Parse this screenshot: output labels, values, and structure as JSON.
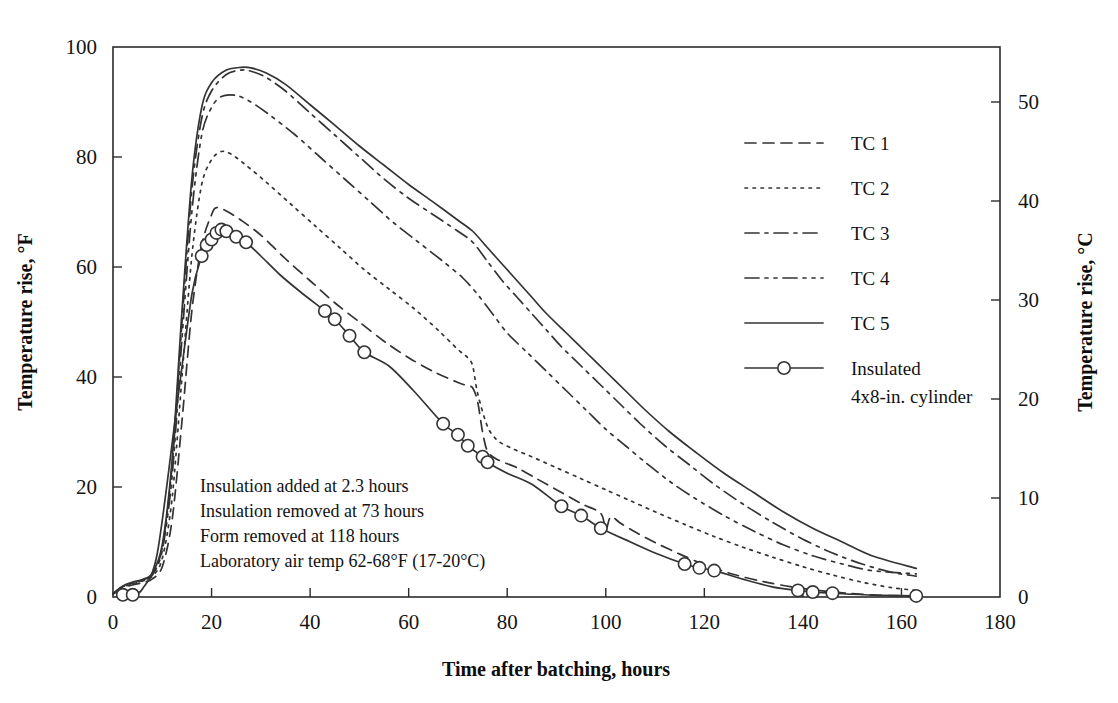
{
  "chart_data": {
    "type": "line",
    "title": "",
    "xlabel": "Time after batching, hours",
    "ylabel": "Temperature rise, °F",
    "ylabel_right": "Temperature rise, °C",
    "xlim": [
      0,
      180
    ],
    "ylim": [
      0,
      100
    ],
    "ylim_right": [
      0,
      55.6
    ],
    "xticks": [
      "0",
      "20",
      "40",
      "60",
      "80",
      "100",
      "120",
      "140",
      "160",
      "180"
    ],
    "xtick_values": [
      0,
      20,
      40,
      60,
      80,
      100,
      120,
      140,
      160,
      180
    ],
    "yticks": [
      "0",
      "20",
      "40",
      "60",
      "80",
      "100"
    ],
    "ytick_values": [
      0,
      20,
      40,
      60,
      80,
      100
    ],
    "yticks_right": [
      "0",
      "10",
      "20",
      "30",
      "40",
      "50"
    ],
    "ytick_values_right": [
      0,
      10,
      20,
      30,
      40,
      50
    ],
    "grid": false,
    "legend_position": "right-inside",
    "series": [
      {
        "name": "TC 1",
        "style": "dashed",
        "dash": "11 7",
        "x": [
          0,
          2,
          4,
          6,
          8,
          10,
          12,
          14,
          16,
          18,
          20,
          21,
          23,
          26,
          30,
          35,
          40,
          45,
          50,
          55,
          60,
          65,
          70,
          72,
          73,
          74,
          75,
          76,
          78,
          82,
          86,
          90,
          95,
          99,
          100,
          101,
          103,
          106,
          110,
          115,
          120,
          126,
          132,
          138,
          144,
          150,
          156,
          163
        ],
        "y": [
          0.5,
          1.6,
          2.2,
          2.6,
          3.3,
          5.5,
          14,
          32,
          52,
          64,
          69.5,
          70.8,
          70.2,
          68.5,
          65.8,
          61.5,
          57.5,
          53.5,
          50,
          46.5,
          43.5,
          41,
          39,
          38.4,
          38,
          35.5,
          30,
          26.5,
          25,
          23.5,
          21.5,
          19.5,
          17,
          15.2,
          12.2,
          14.6,
          13.4,
          11.8,
          9.9,
          7.8,
          5.9,
          4.1,
          2.8,
          1.8,
          1.1,
          0.6,
          0.3,
          0.2
        ]
      },
      {
        "name": "TC 2",
        "style": "dotted",
        "dash": "2.5 5.5",
        "x": [
          0,
          2,
          4,
          6,
          8,
          10,
          12,
          14,
          16,
          18,
          20,
          22,
          24,
          27,
          31,
          36,
          41,
          46,
          51,
          56,
          61,
          66,
          70,
          72,
          73,
          74,
          76,
          78,
          81,
          85,
          90,
          95,
          100,
          105,
          110,
          116,
          122,
          128,
          134,
          140,
          146,
          152,
          158,
          163
        ],
        "y": [
          0.6,
          1.8,
          2.4,
          2.9,
          3.8,
          7,
          18,
          40,
          62,
          75,
          79.5,
          81,
          80.5,
          78.5,
          75.5,
          71.5,
          67.5,
          63.5,
          59.5,
          56,
          52.5,
          48.5,
          45,
          43.5,
          42,
          37,
          31,
          28.5,
          27,
          25.5,
          23.5,
          21.5,
          19.5,
          17.5,
          15.5,
          13.2,
          11,
          9,
          7.2,
          5.5,
          4,
          2.7,
          1.7,
          1.2
        ]
      },
      {
        "name": "TC 3",
        "style": "dash-dot",
        "dash": "14 6 3 6",
        "x": [
          0,
          2,
          4,
          6,
          8,
          10,
          12,
          14,
          16,
          18,
          20,
          23,
          26,
          28,
          31,
          35,
          40,
          45,
          50,
          55,
          60,
          65,
          70,
          73,
          76,
          79,
          82,
          85,
          88,
          91,
          95,
          99,
          103,
          107,
          112,
          117,
          122,
          128,
          134,
          140,
          146,
          152,
          158,
          163
        ],
        "y": [
          0.6,
          1.9,
          2.6,
          3.1,
          4.2,
          9,
          24,
          50,
          74,
          87,
          92,
          95,
          95.8,
          95.6,
          94.5,
          92,
          88,
          84,
          80,
          76,
          72.5,
          69.5,
          66.5,
          64.5,
          61,
          57.5,
          54.5,
          51.5,
          48.5,
          45.5,
          42,
          38.5,
          35,
          31.5,
          27.5,
          24,
          20.5,
          16.8,
          13.5,
          10.5,
          8,
          6,
          4.5,
          3.8
        ]
      },
      {
        "name": "TC 4",
        "style": "dash-dot-dot",
        "dash": "14 6 3 6 3 6",
        "x": [
          0,
          2,
          4,
          6,
          8,
          10,
          12,
          14,
          16,
          18,
          20,
          22,
          25,
          28,
          32,
          37,
          42,
          47,
          52,
          57,
          62,
          67,
          71,
          74,
          77,
          80,
          84,
          88,
          92,
          96,
          100,
          104,
          108,
          113,
          118,
          124,
          130,
          136,
          142,
          148,
          154,
          163
        ],
        "y": [
          0.6,
          1.9,
          2.5,
          3,
          4.0,
          8.5,
          22,
          47,
          70,
          84,
          89,
          91,
          91.2,
          90,
          87.5,
          84,
          80,
          76,
          72,
          68,
          64.5,
          61,
          58,
          55,
          51.5,
          48,
          44.5,
          41,
          37.5,
          34,
          30.5,
          27.5,
          24.5,
          21,
          18,
          14.8,
          12,
          9.5,
          7.5,
          6,
          4.8,
          4.2
        ]
      },
      {
        "name": "TC 5",
        "style": "solid",
        "dash": "none",
        "x": [
          0,
          2,
          4,
          6,
          8,
          10,
          12,
          14,
          16,
          18,
          20,
          23,
          26,
          28,
          31,
          35,
          40,
          45,
          50,
          55,
          60,
          65,
          70,
          73,
          76,
          79,
          82,
          85,
          88,
          92,
          96,
          100,
          104,
          108,
          113,
          118,
          124,
          130,
          136,
          142,
          148,
          154,
          163
        ],
        "y": [
          0.6,
          2.0,
          2.7,
          3.2,
          4.4,
          9.5,
          25,
          52,
          76,
          89,
          93.5,
          95.8,
          96.3,
          96.2,
          95.3,
          93.2,
          89.5,
          85.8,
          82,
          78.5,
          75,
          71.8,
          68.5,
          66.5,
          63.5,
          60.5,
          57.5,
          54.5,
          51.5,
          48,
          44.5,
          41,
          37.5,
          34,
          30,
          26.5,
          22.5,
          19,
          15.5,
          12.5,
          10,
          7.5,
          5.2
        ]
      },
      {
        "name": "Insulated 4x8-in. cylinder",
        "style": "solid-markers",
        "dash": "none",
        "x": [
          2,
          4,
          6,
          9,
          13,
          16,
          18,
          19,
          20,
          21,
          22,
          23,
          25,
          27,
          30,
          34,
          38,
          43,
          45,
          48,
          51,
          56,
          61,
          67,
          70,
          72,
          75,
          76,
          80,
          85,
          91,
          95,
          99,
          105,
          110,
          116,
          119,
          122,
          128,
          134,
          139,
          142,
          146,
          150,
          156,
          163
        ],
        "y": [
          0.4,
          0.4,
          1.5,
          8,
          35,
          55,
          62,
          64,
          65,
          66.2,
          66.8,
          66.5,
          65.5,
          64.5,
          62,
          58.5,
          55.5,
          52,
          50.5,
          47.5,
          44.5,
          42,
          37.5,
          31.5,
          29.5,
          27.5,
          25.5,
          24.5,
          22.5,
          20.5,
          16.5,
          14.8,
          12.5,
          10,
          8,
          6,
          5.3,
          4.8,
          3.2,
          1.8,
          1.2,
          0.9,
          0.7,
          0.5,
          0.3,
          0.2
        ],
        "markers_x": [
          2,
          4,
          18,
          19,
          20,
          21,
          22,
          23,
          25,
          27,
          43,
          45,
          48,
          51,
          67,
          70,
          72,
          75,
          76,
          91,
          95,
          99,
          116,
          119,
          122,
          139,
          142,
          146,
          163
        ],
        "markers_y": [
          0.4,
          0.4,
          62,
          64,
          65,
          66.2,
          66.8,
          66.5,
          65.5,
          64.5,
          52,
          50.5,
          47.5,
          44.5,
          31.5,
          29.5,
          27.5,
          25.5,
          24.5,
          16.5,
          14.8,
          12.5,
          6,
          5.3,
          4.8,
          1.2,
          0.9,
          0.7,
          0.2
        ]
      }
    ],
    "annotations": [
      "Insulation added at 2.3 hours",
      "Insulation removed at 73 hours",
      "Form removed at 118 hours",
      "Laboratory air temp 62-68°F (17-20°C)"
    ],
    "legend": [
      {
        "label": "TC 1",
        "style": "dashed"
      },
      {
        "label": "TC 2",
        "style": "dotted"
      },
      {
        "label": "TC 3",
        "style": "dash-dot"
      },
      {
        "label": "TC 4",
        "style": "dash-dot-dot"
      },
      {
        "label": "TC 5",
        "style": "solid"
      },
      {
        "label": "Insulated",
        "label2": "4x8-in. cylinder",
        "style": "solid-markers"
      }
    ],
    "colors": {
      "line": "#333333",
      "axis": "#2b2b2b",
      "text": "#121212",
      "background": "#ffffff"
    }
  }
}
